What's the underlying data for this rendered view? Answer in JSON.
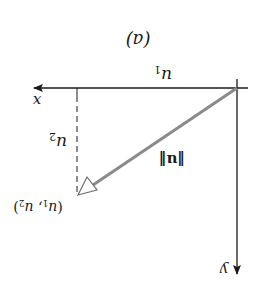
{
  "figure": {
    "orientation": "rotated-180",
    "caption": "(a)",
    "axes": {
      "horizontal_label": "x",
      "vertical_label": "y",
      "horizontal_component_label": "u1",
      "vertical_component_label": "u2"
    },
    "vector": {
      "label": "‖u‖",
      "endpoint_label": "(u1, u2)",
      "color": "#8a8a8a"
    },
    "colors": {
      "axis": "#1a1a1a",
      "vector": "#8a8a8a",
      "background": "#ffffff"
    }
  }
}
